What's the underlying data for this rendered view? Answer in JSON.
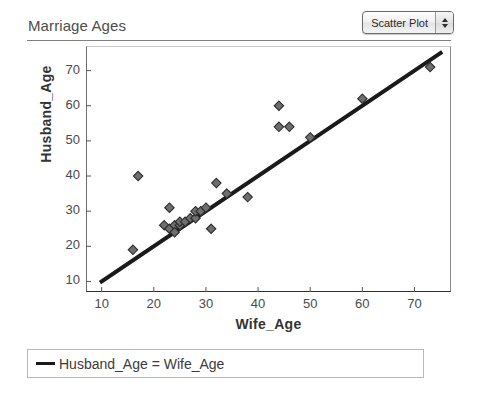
{
  "header": {
    "title": "Marriage Ages",
    "plot_type_selector": {
      "value": "Scatter Plot",
      "up_icon": "caret-up-icon",
      "down_icon": "caret-down-icon"
    }
  },
  "legend": {
    "entries": [
      {
        "label": "Husband_Age = Wife_Age",
        "color": "#1a1a1a",
        "marker": "line"
      }
    ]
  },
  "chart_data": {
    "type": "scatter",
    "title": "Marriage Ages",
    "xlabel": "Wife_Age",
    "ylabel": "Husband_Age",
    "xlim": [
      7,
      77
    ],
    "ylim": [
      7,
      77
    ],
    "xticks": [
      10,
      20,
      30,
      40,
      50,
      60,
      70
    ],
    "yticks": [
      10,
      20,
      30,
      40,
      50,
      60,
      70
    ],
    "grid": false,
    "legend_position": "bottom",
    "marker": {
      "shape": "diamond",
      "fill": "#6e6e6e",
      "edge": "#2d2d2d",
      "size": 7
    },
    "series": [
      {
        "name": "Couples",
        "type": "scatter",
        "points": [
          [
            16,
            19
          ],
          [
            17,
            40
          ],
          [
            22,
            26
          ],
          [
            23,
            31
          ],
          [
            23,
            25
          ],
          [
            24,
            26
          ],
          [
            24,
            24
          ],
          [
            25,
            26
          ],
          [
            25,
            27
          ],
          [
            26,
            27
          ],
          [
            27,
            28
          ],
          [
            28,
            28
          ],
          [
            28,
            30
          ],
          [
            29,
            30
          ],
          [
            30,
            31
          ],
          [
            31,
            25
          ],
          [
            32,
            38
          ],
          [
            34,
            35
          ],
          [
            38,
            34
          ],
          [
            44,
            60
          ],
          [
            44,
            54
          ],
          [
            46,
            54
          ],
          [
            50,
            51
          ],
          [
            60,
            62
          ],
          [
            73,
            71
          ]
        ]
      },
      {
        "name": "Husband_Age = Wife_Age",
        "type": "line",
        "color": "#1a1a1a",
        "width": 4,
        "points": [
          [
            10,
            10
          ],
          [
            75,
            75
          ]
        ]
      }
    ]
  }
}
